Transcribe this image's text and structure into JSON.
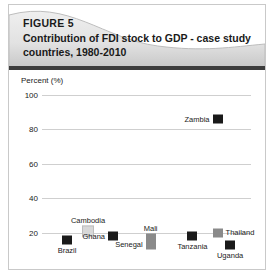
{
  "figure": {
    "number": "FIGURE 5",
    "title": "Contribution of FDI stock to GDP - case study countries, 1980-2010"
  },
  "colors": {
    "border": "#c9c9c9",
    "banner_light": "#f2f2f2",
    "banner_dark": "#c4c4c4",
    "band": "#3d3d3d",
    "gridline": "#cfcfcf",
    "marker_black": "#1a1a1a",
    "marker_gray": "#8a8a8a",
    "marker_light": "#d8d8d8"
  },
  "chart_data": {
    "type": "scatter",
    "title": "Contribution of FDI stock to GDP - case study countries, 1980-2010",
    "subtitle": "FIGURE 5",
    "xlabel": "",
    "ylabel": "Percent (%)",
    "ylim": [
      10,
      100
    ],
    "yticks": [
      100,
      80,
      60,
      40,
      20
    ],
    "ytick_labels": [
      "100",
      "80",
      "60",
      "40",
      "20"
    ],
    "grid": true,
    "legend": "none",
    "points": [
      {
        "name": "Brazil",
        "value": 16,
        "x_pos": 12,
        "color": "#1a1a1a",
        "label_pos": "below"
      },
      {
        "name": "Cambodia",
        "value": 21,
        "x_pos": 22,
        "color": "#d8d8d8",
        "label_pos": "above"
      },
      {
        "name": "Ghana",
        "value": 18,
        "x_pos": 34,
        "color": "#1a1a1a",
        "label_pos": "left"
      },
      {
        "name": "Senegal",
        "value": 13,
        "x_pos": 52,
        "color": "#8a8a8a",
        "label_pos": "left"
      },
      {
        "name": "Mali",
        "value": 17,
        "x_pos": 52,
        "color": "#8a8a8a",
        "label_pos": "above"
      },
      {
        "name": "Tanzania",
        "value": 18,
        "x_pos": 72,
        "color": "#1a1a1a",
        "label_pos": "below"
      },
      {
        "name": "Thailand",
        "value": 20,
        "x_pos": 84,
        "color": "#8a8a8a",
        "label_pos": "right"
      },
      {
        "name": "Uganda",
        "value": 13,
        "x_pos": 90,
        "color": "#1a1a1a",
        "label_pos": "below"
      },
      {
        "name": "Zambia",
        "value": 86,
        "x_pos": 84,
        "color": "#1a1a1a",
        "label_pos": "left"
      }
    ]
  }
}
